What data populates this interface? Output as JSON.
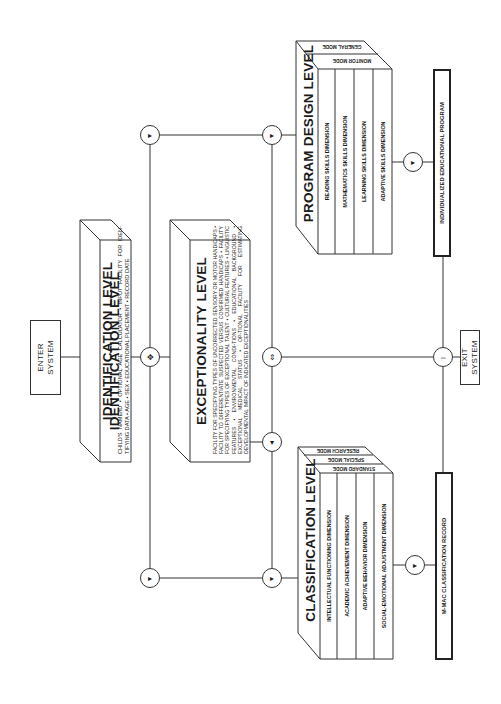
{
  "diagram": {
    "enter": {
      "line1": "ENTER",
      "line2": "SYSTEM"
    },
    "exit": {
      "line1": "EXIT",
      "line2": "SYSTEM"
    },
    "identification": {
      "title": "IDENTIFICATION LEVEL",
      "description": "CHILD'S NAME/ID • OPTIONAL AGE CALCULATOR • INPUT FACILITY FOR IDEN-TIFYING DATA • AGE • SEX • EDUCATIONAL PLACEMENT • RECORD DATE"
    },
    "exceptionality": {
      "title": "EXCEPTIONALITY LEVEL",
      "description": "FACILITY FOR SPECIFYING TYPES OF UNCORRECTED SENSORY OR MOTOR HANDICAPS • FACILITY TO DIFFERENTIATE SUSPECTED VERSUS CONFIRMED HANDICAPS • FACILITY FOR SPECIFYING TYPES OF EXCEPTIONAL TALENT • CULTURAL FEATURES • LINGUISTIC FEATURES • ENVIRONMENTAL CONDI-TIONS • EDUCATIONAL BACKGROUND • EXCEPTIONAL MEDICAL STATUS • OP-TIONAL FACILITY FOR ESTIMATING DEVELOPMENTAL IMPACT OF INDICATED EXCEPTIONALITIES"
    },
    "program_design": {
      "title": "PROGRAM DESIGN LEVEL",
      "modes": [
        "GENERAL MODE",
        "MONITOR MODE"
      ],
      "dimensions": [
        "READING SKILLS DIMENSION",
        "MATHEMATICS SKILLS DIMENSION",
        "LEARNING SKILLS DIMENSION",
        "ADAPTIVE SKILLS DIMENSION"
      ],
      "output": "INDIVIDUALIZED EDUCATIONAL PROGRAM"
    },
    "classification": {
      "title": "CLASSIFICATION LEVEL",
      "modes": [
        "RESEARCH MODE",
        "SPECIAL MODE",
        "STANDARD MODE"
      ],
      "dimensions": [
        "INTELLECTUAL FUNCTIONING DIMENSION",
        "ACADEMIC ACHIEVEMENT DIMENSION",
        "ADAPTIVE BEHAVIOR DIMENSION",
        "SOCIAL-EMOTIONAL ADJUSTMENT DIMENSION"
      ],
      "output": "M-MAC CLASSIFICATION RECORD"
    },
    "junction_icons": {
      "right": "▸",
      "down": "▾",
      "up_down": "⇕",
      "left_right": "⇔",
      "cross": "✥"
    }
  }
}
